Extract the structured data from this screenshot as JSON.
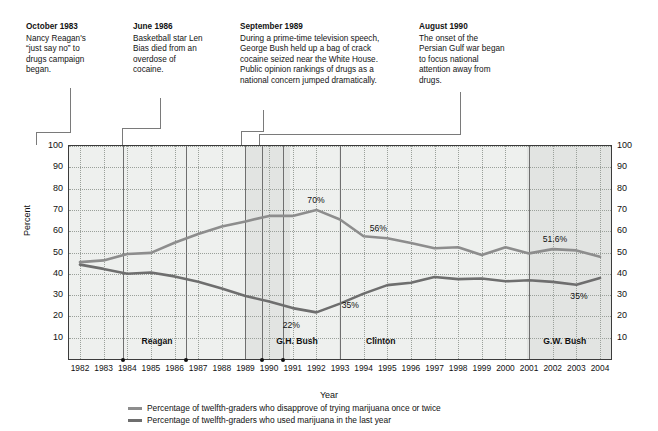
{
  "chart_data": {
    "type": "line",
    "title": "",
    "xlabel": "Year",
    "ylabel": "Percent",
    "ylim": [
      0,
      100
    ],
    "ytick_values": [
      100,
      90,
      80,
      70,
      60,
      50,
      40,
      30,
      20,
      10
    ],
    "grid": true,
    "legend_position": "bottom",
    "categories": [
      1982,
      1983,
      1984,
      1985,
      1986,
      1987,
      1988,
      1989,
      1990,
      1991,
      1992,
      1993,
      1994,
      1995,
      1996,
      1997,
      1998,
      1999,
      2000,
      2001,
      2002,
      2003,
      2004
    ],
    "series": [
      {
        "name": "Percentage of twelfth-graders who disapprove of trying marijuana once or twice",
        "color": "#8d8d8d",
        "values": [
          45.5,
          46.3,
          49.3,
          49.8,
          54.6,
          58.7,
          62.2,
          64.6,
          67.2,
          67.2,
          70.0,
          65.5,
          57.6,
          56.7,
          54.4,
          52.0,
          52.5,
          48.8,
          52.5,
          49.6,
          51.6,
          51.0,
          48.0
        ]
      },
      {
        "name": "Percentage of twelfth-graders who used marijuana in the last year",
        "color": "#6e6e6e",
        "values": [
          44.3,
          42.3,
          40.0,
          40.6,
          38.8,
          36.3,
          33.1,
          29.6,
          27.0,
          23.9,
          21.9,
          26.0,
          30.7,
          34.7,
          35.8,
          38.5,
          37.5,
          37.8,
          36.5,
          37.0,
          36.2,
          34.9,
          38.0
        ]
      }
    ],
    "point_labels": [
      {
        "text": "70%",
        "year": 1992,
        "value": 70.0,
        "series": 0
      },
      {
        "text": "56%",
        "year": 1994,
        "value": 57.6,
        "series": 0
      },
      {
        "text": "51.6%",
        "year": 2002,
        "value": 51.6,
        "series": 0
      },
      {
        "text": "22%",
        "year": 1991,
        "value": 21.9,
        "series": 1
      },
      {
        "text": "35%",
        "year": 1994,
        "value": 30.7,
        "series": 1
      },
      {
        "text": "35%",
        "year": 2003,
        "value": 34.9,
        "series": 1
      }
    ],
    "president_terms": [
      {
        "label": "Reagan",
        "start_year": 1981,
        "end_year": 1989
      },
      {
        "label": "G.H. Bush",
        "start_year": 1989,
        "end_year": 1993
      },
      {
        "label": "Clinton",
        "start_year": 1993,
        "end_year": 2001
      },
      {
        "label": "G.W. Bush",
        "start_year": 2001,
        "end_year": 2004.6
      }
    ]
  },
  "annotations": [
    {
      "title": "October 1983",
      "body": "Nancy Reagan's “just say no” to drugs campaign began.",
      "event_year": 1983.8
    },
    {
      "title": "June 1986",
      "body": "Basketball star Len Bias died from an overdose of cocaine.",
      "event_year": 1986.5
    },
    {
      "title": "September 1989",
      "body": "During a prime-time television speech, George Bush held up a bag of crack cocaine seized near the White House. Public opinion rankings of drugs as a national concern jumped dramatically.",
      "event_year": 1989.7
    },
    {
      "title": "August 1990",
      "body": "The onset of the Persian Gulf war began to focus national attention away from drugs.",
      "event_year": 1990.6
    }
  ],
  "legend": [
    {
      "label": "Percentage of twelfth-graders who disapprove of trying marijuana once or twice",
      "color": "#8d8d8d"
    },
    {
      "label": "Percentage of twelfth-graders who used marijuana in the last year",
      "color": "#6e6e6e"
    }
  ],
  "axis": {
    "x_title": "Year",
    "y_title": "Percent"
  }
}
